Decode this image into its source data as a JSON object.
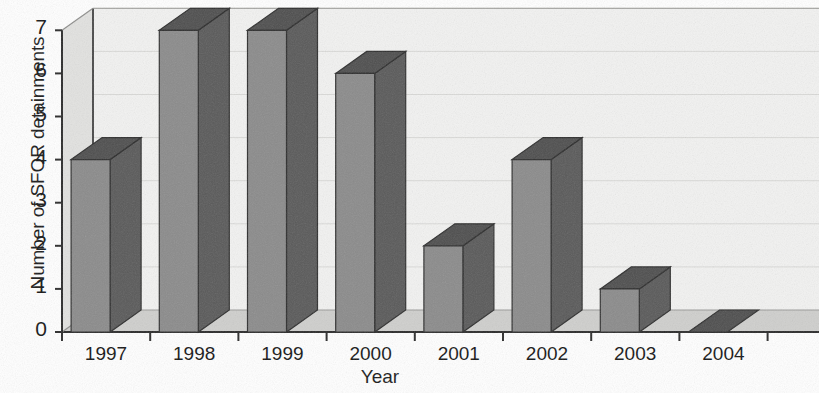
{
  "chart_data": {
    "type": "bar",
    "title": "",
    "subtitle": "",
    "xlabel": "Year",
    "ylabel": "Number of SFOR detainments",
    "categories": [
      "1997",
      "1998",
      "1999",
      "2000",
      "2001",
      "2002",
      "2003",
      "2004"
    ],
    "values": [
      4,
      7,
      7,
      6,
      2,
      4,
      1,
      0
    ],
    "ytick_labels": [
      "0",
      "1",
      "2",
      "3",
      "4",
      "5",
      "6",
      "7"
    ],
    "ytick_values": [
      0,
      1,
      2,
      3,
      4,
      5,
      6,
      7
    ],
    "ylim": [
      0,
      7
    ],
    "grid": true,
    "grid_axis": "y",
    "legend": null,
    "legend_position": "none",
    "style": "3d-column",
    "annotations": [],
    "colors": {
      "bar_front": "#8b8b8b",
      "bar_top": "#4f4f4f",
      "bar_side": "#5a5a5a",
      "bar_outline": "#2e2e2e",
      "back_wall": "#f2f2f1",
      "side_wall": "#e2e2e0",
      "floor": "#cfcfcd",
      "gridline": "#d9d9d7",
      "axis": "#2b2b2b",
      "text": "#151515",
      "background": "#ffffff"
    }
  }
}
